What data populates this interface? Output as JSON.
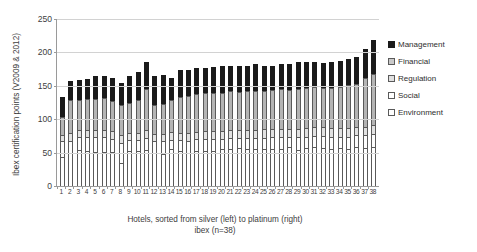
{
  "chart_data": {
    "type": "bar",
    "stacked": true,
    "title": "",
    "xlabel": "Hotels, sorted from silver (left) to platinum (right)",
    "xlabel_line2": "ibex (n=38)",
    "ylabel": "Ibex certification points (V2009 & 2012)",
    "ylim": [
      0,
      250
    ],
    "yticks": [
      0,
      50,
      100,
      150,
      200,
      250
    ],
    "grid": true,
    "legend_position": "right",
    "categories": [
      "1",
      "2",
      "3",
      "4",
      "5",
      "6",
      "7",
      "8",
      "9",
      "10",
      "11",
      "12",
      "13",
      "14",
      "15",
      "16",
      "17",
      "18",
      "19",
      "20",
      "21",
      "22",
      "23",
      "24",
      "25",
      "26",
      "27",
      "28",
      "29",
      "30",
      "31",
      "32",
      "33",
      "34",
      "35",
      "36",
      "37",
      "38"
    ],
    "series": [
      {
        "name": "Environment",
        "color": "#ffffff",
        "values": [
          43,
          50,
          54,
          52,
          51,
          51,
          51,
          35,
          52,
          52,
          54,
          50,
          48,
          55,
          52,
          49,
          52,
          53,
          53,
          56,
          56,
          57,
          56,
          55,
          55,
          55,
          56,
          58,
          54,
          57,
          58,
          57,
          56,
          57,
          56,
          58,
          57,
          58
        ]
      },
      {
        "name": "Social",
        "color": "#ffffff",
        "values": [
          25,
          18,
          19,
          21,
          22,
          22,
          20,
          30,
          17,
          17,
          18,
          17,
          19,
          14,
          17,
          19,
          18,
          17,
          17,
          15,
          16,
          15,
          16,
          17,
          17,
          18,
          17,
          15,
          19,
          17,
          17,
          18,
          18,
          17,
          18,
          18,
          19,
          20
        ]
      },
      {
        "name": "Regulation",
        "color": "#e2e2e2",
        "values": [
          9,
          11,
          11,
          11,
          11,
          11,
          11,
          12,
          11,
          11,
          12,
          11,
          11,
          12,
          11,
          11,
          11,
          12,
          12,
          12,
          12,
          12,
          12,
          12,
          13,
          12,
          12,
          12,
          13,
          13,
          13,
          13,
          13,
          13,
          13,
          13,
          13,
          14
        ]
      },
      {
        "name": "Financial",
        "color": "#b4b4b4",
        "values": [
          27,
          50,
          45,
          46,
          46,
          48,
          46,
          45,
          45,
          49,
          62,
          44,
          45,
          48,
          53,
          56,
          57,
          57,
          58,
          56,
          58,
          57,
          58,
          58,
          57,
          59,
          60,
          59,
          59,
          60,
          60,
          59,
          60,
          62,
          64,
          64,
          72,
          76
        ]
      },
      {
        "name": "Management",
        "color": "#1a1a1a",
        "values": [
          29,
          28,
          30,
          30,
          34,
          32,
          33,
          33,
          39,
          42,
          39,
          43,
          43,
          32,
          40,
          38,
          38,
          38,
          38,
          40,
          38,
          39,
          38,
          40,
          38,
          36,
          38,
          38,
          40,
          38,
          37,
          37,
          39,
          38,
          39,
          40,
          44,
          50
        ]
      }
    ],
    "totals": [
      133,
      157,
      159,
      160,
      164,
      164,
      161,
      155,
      164,
      171,
      185,
      165,
      166,
      161,
      173,
      173,
      176,
      177,
      178,
      179,
      180,
      180,
      180,
      182,
      180,
      180,
      183,
      182,
      185,
      185,
      185,
      184,
      186,
      187,
      190,
      193,
      205,
      218
    ]
  },
  "legend": {
    "items": [
      {
        "label": "Management",
        "swatch": "management-swatch"
      },
      {
        "label": "Financial",
        "swatch": "financial-swatch"
      },
      {
        "label": "Regulation",
        "swatch": "regulation-swatch"
      },
      {
        "label": "Social",
        "swatch": "social-swatch"
      },
      {
        "label": "Environment",
        "swatch": "environment-swatch"
      }
    ]
  }
}
